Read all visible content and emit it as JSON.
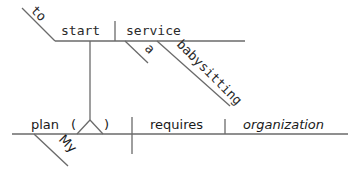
{
  "diagram": {
    "type": "Reed-Kellogg sentence diagram",
    "sentence_words": [
      "My",
      "plan",
      "to",
      "start",
      "a",
      "babysitting",
      "service",
      "requires",
      "organization"
    ],
    "subject": {
      "word": "plan",
      "modifiers": [
        "My"
      ],
      "infinitive_phrase": {
        "marker": "to",
        "verb": "start",
        "object": "service",
        "object_modifiers": [
          "a",
          "babysitting"
        ]
      },
      "open_paren": "(",
      "close_paren": ")"
    },
    "predicate": {
      "verb": "requires",
      "direct_object": "organization"
    },
    "line_color": "#6a6a6a",
    "text_color": "#2a2a2a"
  }
}
